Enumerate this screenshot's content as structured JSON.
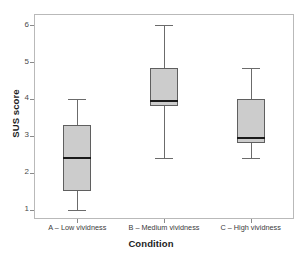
{
  "chart_data": {
    "type": "box",
    "title": "",
    "xlabel": "Condition",
    "ylabel": "SUS score",
    "ylim": [
      0.75,
      6.3
    ],
    "yticks": [
      1,
      2,
      3,
      4,
      5,
      6
    ],
    "ytick_labels": [
      "1",
      "2",
      "3",
      "4",
      "5",
      "6"
    ],
    "grid": false,
    "legend": "none",
    "categories": [
      "A – Low vividness",
      "B – Medium vividness",
      "C – High vividness"
    ],
    "boxes": [
      {
        "category": "A – Low vividness",
        "whisker_low": 1.0,
        "q1": 1.5,
        "median": 2.4,
        "q3": 3.3,
        "whisker_high": 4.0
      },
      {
        "category": "B – Medium vividness",
        "whisker_low": 2.4,
        "q1": 3.8,
        "median": 3.95,
        "q3": 4.85,
        "whisker_high": 6.0
      },
      {
        "category": "C – High vividness",
        "whisker_low": 2.4,
        "q1": 2.8,
        "median": 2.95,
        "q3": 4.0,
        "whisker_high": 4.85
      }
    ],
    "colors": {
      "box_fill": "#cccccc",
      "box_border": "#5f5f5f",
      "median": "#1a1a1a",
      "whisker": "#6b6b6b",
      "frame": "#b9b9b9",
      "background": "#ffffff",
      "text": "#2b2b2b"
    }
  }
}
